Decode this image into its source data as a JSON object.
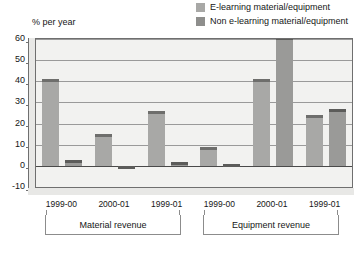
{
  "chart_data": {
    "type": "bar",
    "title": "",
    "subtitle": "",
    "xlabel": "",
    "ylabel": "% per year",
    "ylim": [
      -10,
      60
    ],
    "yticks": [
      60,
      50,
      40,
      30,
      20,
      10,
      0,
      -10
    ],
    "grid": true,
    "legend_position": "top-right",
    "categories": [
      "1999-00",
      "2000-01",
      "1999-01",
      "1999-00",
      "2000-01",
      "1999-01"
    ],
    "groups": [
      {
        "label": "Material revenue",
        "categories": [
          "1999-00",
          "2000-01",
          "1999-01"
        ]
      },
      {
        "label": "Equipment revenue",
        "categories": [
          "1999-00",
          "2000-01",
          "1999-01"
        ]
      }
    ],
    "series": [
      {
        "name": "E-learning material/equipment",
        "color": "#a8a8a6",
        "cap_color": "#6e6e6c",
        "values": [
          41,
          15,
          26,
          9,
          41,
          24
        ]
      },
      {
        "name": "Non e-learning material/equipment",
        "color": "#9a9a98",
        "cap_color": "#5c5c5a",
        "values": [
          3,
          -1,
          2,
          1,
          61,
          27
        ]
      }
    ]
  },
  "legend": {
    "items": [
      {
        "label": "E-learning material/equipment",
        "color": "#a8a8a6"
      },
      {
        "label": "Non e-learning material/equipment",
        "color": "#8e8e8c"
      }
    ]
  },
  "axis": {
    "y_title": "% per year",
    "y_ticks": [
      "60",
      "50",
      "40",
      "30",
      "20",
      "10",
      "0",
      "-10"
    ]
  },
  "x_labels": [
    "1999-00",
    "2000-01",
    "1999-01",
    "1999-00",
    "2000-01",
    "1999-01"
  ],
  "group_labels": [
    "Material revenue",
    "Equipment revenue"
  ],
  "colors": {
    "plot_background": "#f2f2f0",
    "frame": "#6f6f6f",
    "gridline": "#9a9a9a",
    "shoulder": "#e8e8e6",
    "text": "#161616"
  }
}
